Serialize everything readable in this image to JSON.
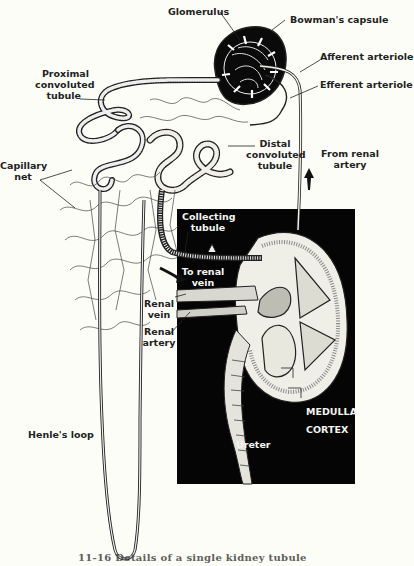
{
  "diagram": {
    "labels": {
      "glomerulus": "Glomerulus",
      "bowmans_capsule": "Bowman's capsule",
      "afferent_arteriole": "Afferent arteriole",
      "efferent_arteriole": "Efferent arteriole",
      "proximal_1": "Proximal",
      "proximal_2": "convoluted",
      "proximal_3": "tubule",
      "distal_1": "Distal",
      "distal_2": "convoluted",
      "distal_3": "tubule",
      "from_renal_1": "From renal",
      "from_renal_2": "artery",
      "capillary_1": "Capillary",
      "capillary_2": "net",
      "collecting_1": "Collecting",
      "collecting_2": "tubule",
      "to_renal_1": "To renal",
      "to_renal_2": "vein",
      "renal_vein_1": "Renal",
      "renal_vein_2": "vein",
      "renal_artery_1": "Renal",
      "renal_artery_2": "artery",
      "medulla": "MEDULLA",
      "cortex": "CORTEX",
      "ureter": "Ureter",
      "henles_loop": "Henle's loop"
    },
    "caption": "11-16  Details of a single kidney tubule",
    "colors": {
      "background": "#fdfdf8",
      "ink": "#1a1a1a",
      "inset_background": "#050505",
      "inset_text": "#f4f4f0"
    }
  }
}
